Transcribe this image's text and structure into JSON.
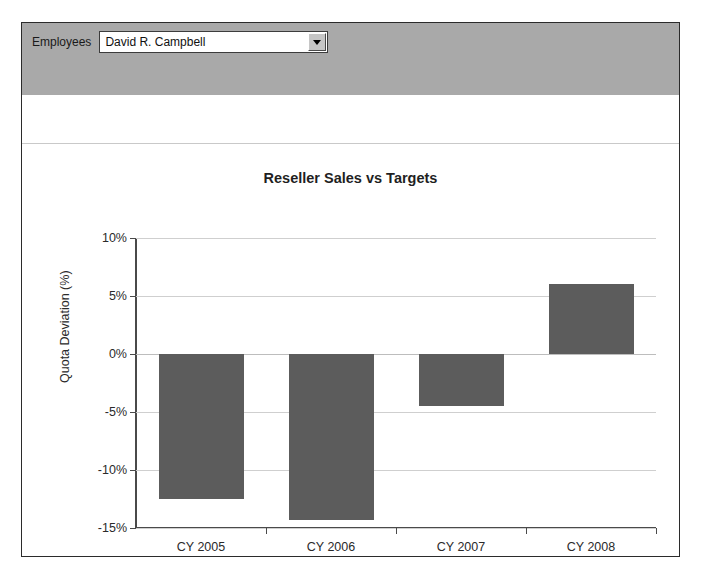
{
  "panel": {
    "parameters": {
      "employees_label": "Employees",
      "employees_value": "David R. Campbell",
      "dropdown_icon": "chevron-down-icon"
    }
  },
  "chart_data": {
    "type": "bar",
    "title": "Reseller Sales vs Targets",
    "xlabel": "",
    "ylabel": "Quota Deviation (%)",
    "categories": [
      "CY 2005",
      "CY 2006",
      "CY 2007",
      "CY 2008"
    ],
    "values": [
      -12.5,
      -14.3,
      -4.5,
      6.0
    ],
    "ylim": [
      -15,
      10
    ],
    "ytick_values": [
      10,
      5,
      0,
      -5,
      -10,
      -15
    ],
    "ytick_labels": [
      "10%",
      "5%",
      "0%",
      "-5%",
      "-10%",
      "-15%"
    ],
    "grid": true,
    "legend": "none",
    "bar_color": "#5c5c5c",
    "gridline_color": "#cfcfcf",
    "axis_color": "#4a4a4a"
  }
}
